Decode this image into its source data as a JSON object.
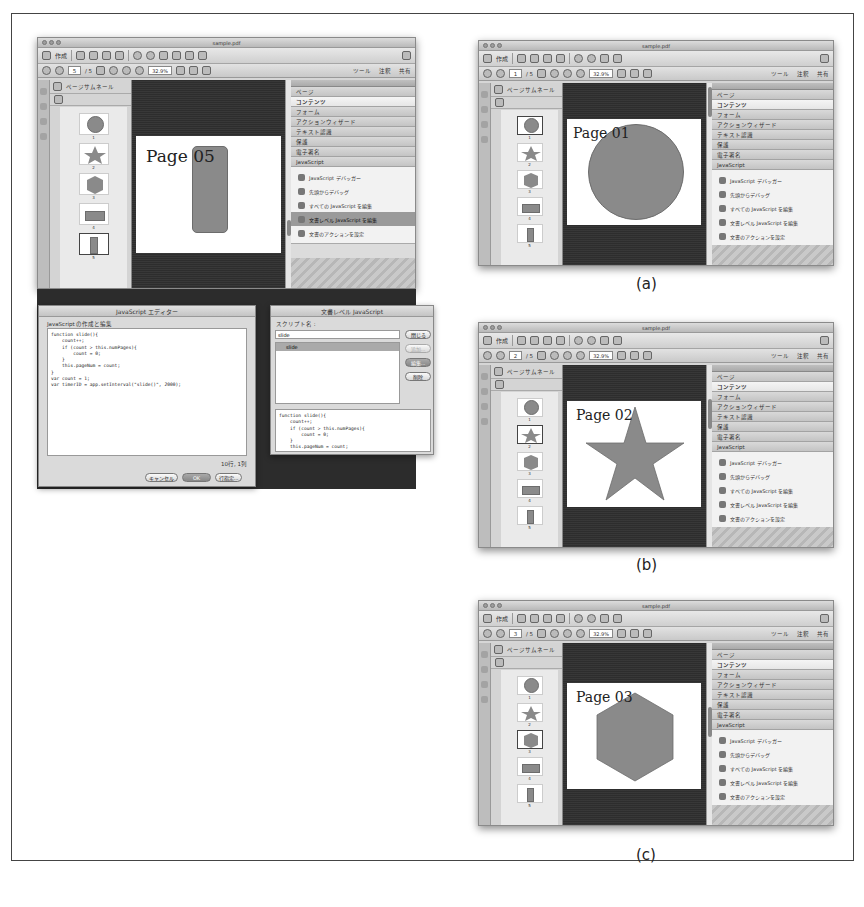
{
  "app": {
    "window_title": "sample.pdf",
    "toolbar": {
      "create_label": "作成",
      "page_total": "/ 5",
      "zoom_value": "32.9%",
      "tools_label": "ツール",
      "comment_label": "注釈",
      "share_label": "共有"
    },
    "thumbnail_panel": {
      "title": "ページサムネール",
      "pages": [
        "1",
        "2",
        "3",
        "4",
        "5"
      ]
    },
    "right_panel": {
      "sections": [
        "ページ",
        "コンテンツ",
        "フォーム",
        "アクションウィザード",
        "テキスト認識",
        "保護",
        "電子署名",
        "JavaScript"
      ],
      "js_items": [
        "JavaScript デバッガー",
        "先頭からデバッグ",
        "すべての JavaScript を編集",
        "文書レベル JavaScript を編集",
        "文書のアクションを設定"
      ]
    }
  },
  "panels": {
    "main": {
      "current_page": "5",
      "page_label": "Page 05",
      "shape": "rounded-rectangle",
      "selected_js_item": "文書レベル JavaScript を編集"
    },
    "a": {
      "caption": "(a)",
      "current_page": "1",
      "page_label": "Page 01",
      "shape": "circle"
    },
    "b": {
      "caption": "(b)",
      "current_page": "2",
      "page_label": "Page 02",
      "shape": "star"
    },
    "c": {
      "caption": "(c)",
      "current_page": "3",
      "page_label": "Page 03",
      "shape": "hexagon"
    }
  },
  "js_editor": {
    "title": "JavaScript エディター",
    "group_label": "JavaScript の作成と編集",
    "code": "function slide(){\n    count++;\n    if (count > this.numPages){\n        count = 0;\n    }\n    this.pageNum = count;\n}\nvar count = 1;\nvar timerID = app.setInterval(\"slide()\", 2000);",
    "position": "10行, 1列",
    "buttons": {
      "cancel": "キャンセル",
      "ok": "OK",
      "goto": "行指定..."
    }
  },
  "doc_js_dialog": {
    "title": "文書レベル JavaScript",
    "script_name_label": "スクリプト名 :",
    "script_name_value": "slide",
    "scripts": [
      "slide"
    ],
    "preview": "function slide(){\n    count++;\n    if (count > this.numPages){\n        count = 0;\n    }\n    this.pageNum = count;",
    "buttons": {
      "close": "閉じる",
      "add": "追加...",
      "edit": "編集...",
      "delete": "削除"
    }
  }
}
